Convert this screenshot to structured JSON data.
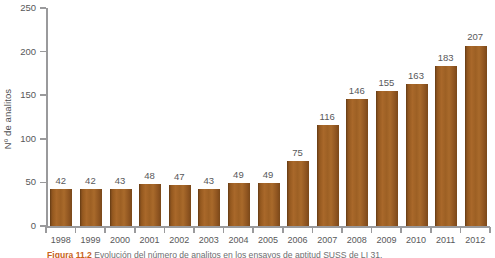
{
  "chart_data": {
    "type": "bar",
    "title": "",
    "xlabel": "",
    "ylabel": "Nº de analitos",
    "categories": [
      "1998",
      "1999",
      "2000",
      "2001",
      "2002",
      "2003",
      "2004",
      "2005",
      "2006",
      "2007",
      "2008",
      "2009",
      "2010",
      "2011",
      "2012"
    ],
    "values": [
      42,
      42,
      43,
      48,
      47,
      43,
      49,
      49,
      75,
      116,
      146,
      155,
      163,
      183,
      207
    ],
    "value_labels": [
      "42",
      "42",
      "43",
      "48",
      "47",
      "43",
      "49",
      "49",
      "75",
      "116",
      "146",
      "155",
      "163",
      "183",
      "207"
    ],
    "ylim": [
      0,
      250
    ],
    "yticks": [
      0,
      50,
      100,
      150,
      200,
      250
    ],
    "ytick_labels": [
      "0",
      "50",
      "100",
      "150",
      "200",
      "250"
    ],
    "grid": false,
    "legend": null,
    "series": [
      {
        "name": "Nº de analitos",
        "color": "#9d6024",
        "values": [
          42,
          42,
          43,
          48,
          47,
          43,
          49,
          49,
          75,
          116,
          146,
          155,
          163,
          183,
          207
        ]
      }
    ],
    "colors": {
      "bar": "#9d6024",
      "bar_dark": "#7a4819",
      "axis": "#9a9a9c",
      "text": "#58585a",
      "caption_tag": "#c8621a",
      "background": "#ffffff"
    }
  },
  "caption": {
    "tag": "Figura 11.2",
    "text": "Evolución del número de analitos en los ensayos de aptitud SUSS de LI 31."
  }
}
